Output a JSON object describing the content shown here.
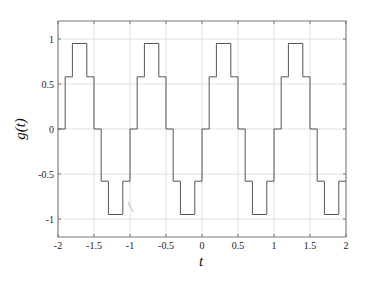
{
  "chart_data": {
    "type": "line",
    "style": "step",
    "title": "",
    "xlabel": "t",
    "ylabel": "g(t)",
    "xlim": [
      -2,
      2
    ],
    "ylim": [
      -1.2,
      1.2
    ],
    "grid": true,
    "legend": null,
    "xticks": [
      -2,
      -1.5,
      -1,
      -0.5,
      0,
      0.5,
      1,
      1.5,
      2
    ],
    "xtick_labels": [
      "-2",
      "-1.5",
      "-1",
      "-0.5",
      "0",
      "0.5",
      "1",
      "1.5",
      "2"
    ],
    "yticks": [
      1,
      0.5,
      0,
      -0.5,
      -1
    ],
    "ytick_labels": [
      "1",
      "0.5",
      "0",
      "-0.5",
      "-1"
    ],
    "period": 1,
    "series": [
      {
        "name": "g(t)",
        "color": "#555555",
        "x": [
          -2,
          -1.9,
          -1.9,
          -1.8,
          -1.8,
          -1.6,
          -1.6,
          -1.5,
          -1.5,
          -1.4,
          -1.4,
          -1.3,
          -1.3,
          -1.1,
          -1.1,
          -1.0,
          -1.0,
          -0.9,
          -0.9,
          -0.8,
          -0.8,
          -0.6,
          -0.6,
          -0.5,
          -0.5,
          -0.4,
          -0.4,
          -0.3,
          -0.3,
          -0.1,
          -0.1,
          0.0,
          0.0,
          0.1,
          0.1,
          0.2,
          0.2,
          0.4,
          0.4,
          0.5,
          0.5,
          0.6,
          0.6,
          0.7,
          0.7,
          0.9,
          0.9,
          1.0,
          1.0,
          1.1,
          1.1,
          1.2,
          1.2,
          1.4,
          1.4,
          1.5,
          1.5,
          1.6,
          1.6,
          1.7,
          1.7,
          1.9,
          1.9,
          2.0
        ],
        "y": [
          0,
          0,
          0.58,
          0.58,
          0.95,
          0.95,
          0.58,
          0.58,
          0,
          0,
          -0.58,
          -0.58,
          -0.95,
          -0.95,
          -0.58,
          -0.58,
          0,
          0,
          0.58,
          0.58,
          0.95,
          0.95,
          0.58,
          0.58,
          0,
          0,
          -0.58,
          -0.58,
          -0.95,
          -0.95,
          -0.58,
          -0.58,
          0,
          0,
          0.58,
          0.58,
          0.95,
          0.95,
          0.58,
          0.58,
          0,
          0,
          -0.58,
          -0.58,
          -0.95,
          -0.95,
          -0.58,
          -0.58,
          0,
          0,
          0.58,
          0.58,
          0.95,
          0.95,
          0.58,
          0.58,
          0,
          0,
          -0.58,
          -0.58,
          -0.95,
          -0.95,
          -0.58,
          -0.58
        ]
      }
    ]
  },
  "colors": {
    "line": "#555555",
    "grid": "#e0e0e0",
    "axes": "#777777",
    "background": "#ffffff"
  }
}
